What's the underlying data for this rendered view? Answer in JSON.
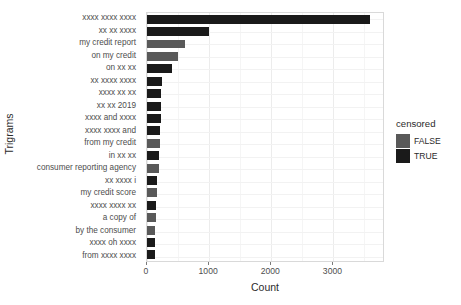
{
  "chart_data": {
    "type": "bar",
    "orientation": "horizontal",
    "title": "",
    "xlabel": "Count",
    "ylabel": "Trigrams",
    "xlim": [
      0,
      3830
    ],
    "xticks": [
      0,
      1000,
      2000,
      3000
    ],
    "xtick_labels": [
      "0",
      "1000",
      "2000",
      "3000"
    ],
    "grid": true,
    "legend": {
      "title": "censored",
      "position": "right",
      "entries": [
        {
          "label": "FALSE",
          "color": "#595959"
        },
        {
          "label": "TRUE",
          "color": "#1a1a1a"
        }
      ]
    },
    "categories": [
      "xxxx xxxx xxxx",
      "xx xx xxxx",
      "my credit report",
      "on my credit",
      "on xx xx",
      "xx xxxx xxxx",
      "xxxx xx xx",
      "xx xx 2019",
      "xxxx and xxxx",
      "xxxx xxxx and",
      "from my credit",
      "in xx xx",
      "consumer reporting agency",
      "xx xxxx i",
      "my credit score",
      "xxxx xxxx xx",
      "a copy of",
      "by the consumer",
      "xxxx oh xxxx",
      "from xxxx xxxx"
    ],
    "values": [
      3590,
      1000,
      610,
      500,
      400,
      235,
      230,
      225,
      220,
      215,
      205,
      195,
      190,
      160,
      155,
      150,
      140,
      135,
      130,
      125
    ],
    "censored": [
      "TRUE",
      "TRUE",
      "FALSE",
      "FALSE",
      "TRUE",
      "TRUE",
      "TRUE",
      "TRUE",
      "TRUE",
      "TRUE",
      "FALSE",
      "TRUE",
      "FALSE",
      "TRUE",
      "FALSE",
      "TRUE",
      "FALSE",
      "FALSE",
      "TRUE",
      "TRUE"
    ]
  }
}
